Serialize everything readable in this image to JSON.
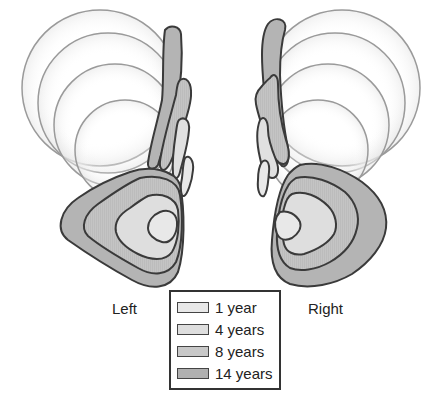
{
  "figure": {
    "sides": [
      {
        "id": "left",
        "label": "Left"
      },
      {
        "id": "right",
        "label": "Right"
      }
    ],
    "legend": {
      "items": [
        {
          "label": "1 year",
          "color": "#e8e8e8"
        },
        {
          "label": "4 years",
          "color": "#dedede"
        },
        {
          "label": "8 years",
          "color": "#c8c8c8"
        },
        {
          "label": "14 years",
          "color": "#b0b0b0"
        }
      ]
    },
    "colors": {
      "outline": "#3a3a3a",
      "circle_stroke": "#999999",
      "background": "#ffffff"
    }
  }
}
